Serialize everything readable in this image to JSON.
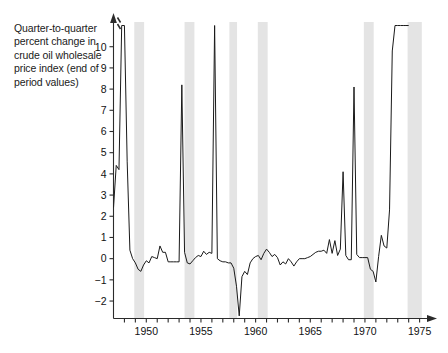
{
  "figure": {
    "caption": "Quarter-to-quarter percent change in crude oil wholesale price index (end of period values)",
    "background_color": "#ffffff",
    "line_color": "#1a1a1a",
    "recession_band_color": "#e4e4e4",
    "axis_color": "#2b2b2b"
  },
  "chart_data": {
    "type": "line",
    "title": "Quarter-to-quarter percent change in crude oil wholesale price index (end of period values)",
    "xlabel": "",
    "ylabel": "Quarter-to-quarter percent change",
    "xlim": [
      1947.0,
      1976.5
    ],
    "ylim": [
      -2.8,
      10.6
    ],
    "yticks": [
      -2,
      -1,
      0,
      1,
      2,
      3,
      4,
      5,
      6,
      7,
      8,
      9,
      10
    ],
    "ytick_labels": [
      "−2",
      "−1",
      "0",
      "1",
      "2",
      "3",
      "4",
      "5",
      "6",
      "7",
      "8",
      "9",
      "10"
    ],
    "xticks": [
      1948,
      1949,
      1950,
      1951,
      1952,
      1953,
      1954,
      1955,
      1956,
      1957,
      1958,
      1959,
      1960,
      1961,
      1962,
      1963,
      1964,
      1965,
      1966,
      1967,
      1968,
      1969,
      1970,
      1971,
      1972,
      1973,
      1974,
      1975,
      1976
    ],
    "xtick_labels_shown": [
      "1950",
      "1955",
      "1960",
      "1965",
      "1970",
      "1975"
    ],
    "xtick_label_values": [
      1950,
      1955,
      1960,
      1965,
      1970,
      1975
    ],
    "grid": false,
    "legend": false,
    "axis_break": {
      "present": true,
      "location": "y-axis above 10",
      "note": "double slash break marks; axis arrow at top indicates values exceed plotted range"
    },
    "recession_bands": [
      {
        "start": 1948.9,
        "end": 1949.8
      },
      {
        "start": 1953.5,
        "end": 1954.4
      },
      {
        "start": 1957.6,
        "end": 1958.3
      },
      {
        "start": 1960.2,
        "end": 1961.1
      },
      {
        "start": 1969.9,
        "end": 1970.8
      },
      {
        "start": 1973.9,
        "end": 1975.2
      }
    ],
    "series": [
      {
        "name": "Crude oil wholesale price index, quarterly percent change",
        "x": [
          1947.0,
          1947.25,
          1947.5,
          1947.75,
          1948.0,
          1948.25,
          1948.5,
          1948.75,
          1949.0,
          1949.25,
          1949.5,
          1949.75,
          1950.0,
          1950.25,
          1950.5,
          1950.75,
          1951.0,
          1951.25,
          1951.5,
          1951.75,
          1952.0,
          1952.25,
          1952.5,
          1952.75,
          1953.0,
          1953.25,
          1953.5,
          1953.75,
          1954.0,
          1954.25,
          1954.5,
          1954.75,
          1955.0,
          1955.25,
          1955.5,
          1955.75,
          1956.0,
          1956.25,
          1956.5,
          1956.75,
          1957.0,
          1957.25,
          1957.5,
          1957.75,
          1958.0,
          1958.25,
          1958.5,
          1958.75,
          1959.0,
          1959.25,
          1959.5,
          1959.75,
          1960.0,
          1960.25,
          1960.5,
          1960.75,
          1961.0,
          1961.25,
          1961.5,
          1961.75,
          1962.0,
          1962.25,
          1962.5,
          1962.75,
          1963.0,
          1963.25,
          1963.5,
          1963.75,
          1964.0,
          1964.25,
          1964.5,
          1964.75,
          1965.0,
          1965.25,
          1965.5,
          1965.75,
          1966.0,
          1966.25,
          1966.5,
          1966.75,
          1967.0,
          1967.25,
          1967.5,
          1967.75,
          1968.0,
          1968.25,
          1968.5,
          1968.75,
          1969.0,
          1969.25,
          1969.5,
          1969.75,
          1970.0,
          1970.25,
          1970.5,
          1970.75,
          1971.0,
          1971.25,
          1971.5,
          1971.75,
          1972.0,
          1972.25,
          1972.5,
          1972.75,
          1973.0,
          1973.25,
          1973.5,
          1973.75,
          1974.0
        ],
        "values": [
          2.4,
          4.4,
          4.2,
          11.0,
          11.0,
          4.6,
          0.4,
          0.0,
          -0.2,
          -0.5,
          -0.6,
          -0.3,
          -0.1,
          -0.2,
          0.1,
          0.05,
          0.0,
          0.6,
          0.3,
          0.3,
          -0.15,
          -0.15,
          -0.15,
          -0.15,
          -0.15,
          8.2,
          0.3,
          -0.2,
          -0.25,
          -0.1,
          0.05,
          0.15,
          0.1,
          0.35,
          0.2,
          0.3,
          0.25,
          11.0,
          0.0,
          -0.1,
          -0.15,
          -0.15,
          -0.2,
          -0.2,
          -0.45,
          -1.3,
          -2.7,
          -0.85,
          -0.6,
          -0.75,
          -0.2,
          0.0,
          0.1,
          0.15,
          -0.05,
          0.25,
          0.45,
          0.3,
          0.1,
          0.2,
          0.05,
          -0.3,
          -0.15,
          -0.25,
          0.0,
          -0.15,
          -0.35,
          -0.15,
          0.0,
          0.0,
          0.0,
          0.05,
          0.1,
          0.2,
          0.3,
          0.35,
          0.35,
          0.4,
          0.25,
          0.9,
          0.25,
          0.85,
          0.15,
          0.45,
          4.1,
          0.15,
          -0.05,
          -0.05,
          8.1,
          0.2,
          0.05,
          0.05,
          0.05,
          0.05,
          -0.5,
          -0.6,
          -1.1,
          0.1,
          1.1,
          0.6,
          0.5,
          2.3,
          9.8,
          11.0,
          11.0,
          11.0,
          11.0,
          11.0,
          11.0
        ],
        "clipped_above": 10.5,
        "note": "Spikes at 1947Q4-1948Q1, 1956Q2, 1973-1974 exceed the top of the plotted range and are cut off by the axis break."
      }
    ]
  }
}
